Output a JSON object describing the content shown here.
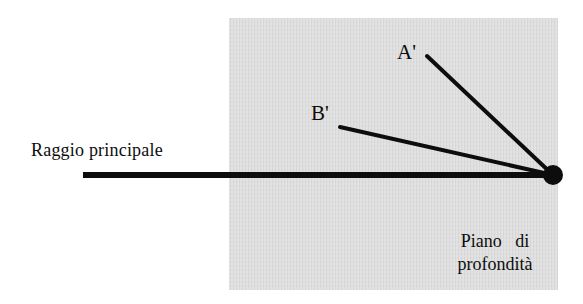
{
  "figure": {
    "title_text_language": "it",
    "background_color": "#ffffff",
    "ink_color": "#0d0d0d"
  },
  "depth_plane": {
    "name": "Piano di profondità",
    "fill_color": "#d9d9d9",
    "x": 229,
    "y": 18,
    "width": 329,
    "height": 272
  },
  "labels": {
    "principal_ray": "Raggio principale",
    "point_a": "A'",
    "point_b": "B'",
    "plane_line_1": "Piano  di",
    "plane_line_2": "profondità"
  },
  "diagram_data": {
    "type": "line-diagram",
    "vertex": {
      "label": "O",
      "x": 553,
      "y": 175,
      "radius": 10
    },
    "rays": [
      {
        "name": "principal-ray",
        "label": "Raggio principale",
        "from": {
          "x": 83,
          "y": 175
        },
        "to": {
          "x": 553,
          "y": 175
        },
        "stroke_width": 6,
        "color": "#0d0d0d"
      },
      {
        "name": "ray-to-a",
        "label": "A'",
        "from": {
          "x": 427,
          "y": 56
        },
        "to": {
          "x": 553,
          "y": 175
        },
        "stroke_width": 4,
        "color": "#0d0d0d"
      },
      {
        "name": "ray-to-b",
        "label": "B'",
        "from": {
          "x": 340,
          "y": 127
        },
        "to": {
          "x": 553,
          "y": 175
        },
        "stroke_width": 4,
        "color": "#0d0d0d"
      }
    ]
  }
}
